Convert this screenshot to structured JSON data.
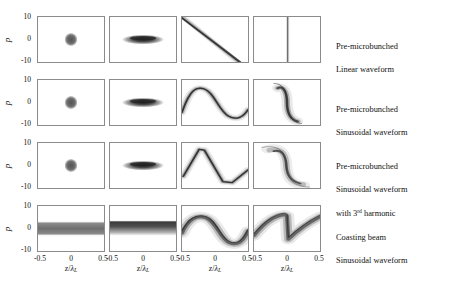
{
  "figure": {
    "axis": {
      "y_label": "p",
      "y_ticks": [
        "10",
        "0",
        "-10"
      ],
      "y_range": [
        -10,
        10
      ],
      "x_label_prefix": "z/",
      "x_label_symbol": "λ",
      "x_label_subscript": "L",
      "x_ticks": [
        "-0.5",
        "0",
        "0.5"
      ],
      "x_range": [
        -0.5,
        0.5
      ]
    },
    "rows": [
      {
        "id": "row-1",
        "caption_line1": "Pre-microbunched",
        "caption_line2": "Linear waveform",
        "caption_line3": "",
        "caption_sup": "",
        "panels": [
          {
            "id": "r1c1",
            "kind": "blob-round",
            "note": "compact round bunch at z=0, p=0"
          },
          {
            "id": "r1c2",
            "kind": "blob-flat",
            "note": "horizontally stretched ellipse, dense core"
          },
          {
            "id": "r1c3",
            "kind": "diagonal-line",
            "note": "steep negative-slope chirped streak from upper-left to lower-right"
          },
          {
            "id": "r1c4",
            "kind": "vertical-line",
            "note": "fully compressed vertical spike near z=0"
          }
        ]
      },
      {
        "id": "row-2",
        "caption_line1": "Pre-microbunched",
        "caption_line2": "Sinusoidal waveform",
        "caption_line3": "",
        "caption_sup": "",
        "panels": [
          {
            "id": "r2c1",
            "kind": "blob-round",
            "note": "compact round bunch at z=0, p=0"
          },
          {
            "id": "r2c2",
            "kind": "blob-flat",
            "note": "horizontally stretched ellipse, dense core"
          },
          {
            "id": "r2c3",
            "kind": "sine",
            "note": "single sinusoidal modulation: crest left of center, trough right"
          },
          {
            "id": "r2c4",
            "kind": "s-curve",
            "note": "rotated S-shaped fold near z=0 after compression"
          }
        ]
      },
      {
        "id": "row-3",
        "caption_line1": "Pre-microbunched",
        "caption_line2": "Sinusoidal waveform",
        "caption_line3": "with 3",
        "caption_sup": "rd",
        "caption_line3_tail": " harmonic",
        "panels": [
          {
            "id": "r3c1",
            "kind": "blob-round",
            "note": "compact round bunch at z=0, p=0"
          },
          {
            "id": "r3c2",
            "kind": "blob-flat",
            "note": "horizontally stretched ellipse, dense core"
          },
          {
            "id": "r3c3",
            "kind": "sawtooth",
            "note": "linearized sawtooth waveform from added 3rd harmonic"
          },
          {
            "id": "r3c4",
            "kind": "s-curve-sharp",
            "note": "sharper folded structure with sparse wings"
          }
        ]
      },
      {
        "id": "row-4",
        "caption_line1": "Coasting beam",
        "caption_line2": "Sinusoidal waveform",
        "caption_line3": "",
        "caption_sup": "",
        "panels": [
          {
            "id": "r4c1",
            "kind": "band",
            "note": "uniform coasting band across full z range"
          },
          {
            "id": "r4c2",
            "kind": "band-dense",
            "note": "uniform band, denser upper edge"
          },
          {
            "id": "r4c3",
            "kind": "sine-thick",
            "note": "thick sinusoidal modulation across full z range"
          },
          {
            "id": "r4c4",
            "kind": "sawtooth-thick",
            "note": "thick sawtooth/over-rotated structure with sharp jump near z=0"
          }
        ]
      }
    ],
    "colors": {
      "axis": "#8b8b8b",
      "ink": "#1a1a1a",
      "text": "#111111"
    }
  }
}
